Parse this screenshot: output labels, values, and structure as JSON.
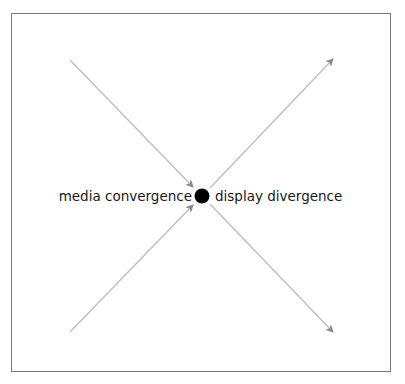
{
  "diagram": {
    "type": "convergence-divergence",
    "labels": {
      "left": "media convergence",
      "right": "display divergence"
    },
    "center_node": {
      "x": 202,
      "y": 196,
      "r": 7,
      "color": "#000000"
    },
    "arrows": [
      {
        "name": "incoming-top-left",
        "from": [
          70,
          60
        ],
        "to": [
          193,
          187
        ],
        "direction": "in"
      },
      {
        "name": "incoming-bottom-left",
        "from": [
          70,
          332
        ],
        "to": [
          193,
          205
        ],
        "direction": "in"
      },
      {
        "name": "outgoing-top-right",
        "from": [
          210,
          188
        ],
        "to": [
          333,
          59
        ],
        "direction": "out"
      },
      {
        "name": "outgoing-bottom-right",
        "from": [
          210,
          204
        ],
        "to": [
          333,
          332
        ],
        "direction": "out"
      }
    ],
    "colors": {
      "line": "#bdbdbd",
      "arrowhead": "#8a8a8a",
      "border": "#7a7a7a",
      "text": "#1a1a1a"
    }
  }
}
